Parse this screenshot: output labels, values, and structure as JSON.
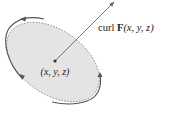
{
  "diagram": {
    "vector_label": {
      "prefix": "curl ",
      "bold": "F",
      "args": "(x, y, z)"
    },
    "point_label": "(x, y, z)",
    "colors": {
      "disk_fill": "#e4e4e4",
      "curve": "#555555",
      "arrow": "#666666",
      "text": "#222222"
    }
  }
}
